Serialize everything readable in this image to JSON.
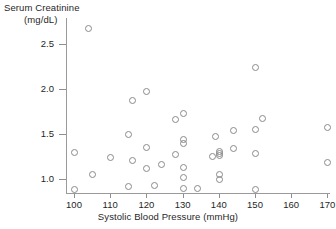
{
  "chart_data": {
    "type": "scatter",
    "title": "",
    "xlabel": "Systolic Blood Pressure (mmHg)",
    "ylabel_line1": "Serum Creatinine",
    "ylabel_line2": "(mg/dL)",
    "xlim": [
      96,
      173
    ],
    "ylim": [
      0.82,
      2.78
    ],
    "xticks": [
      100,
      110,
      120,
      130,
      140,
      150,
      160,
      170
    ],
    "xticklabels": [
      "100",
      "110",
      "120",
      "130",
      "140",
      "150",
      "160",
      "170"
    ],
    "yticks": [
      1.0,
      1.5,
      2.0,
      2.5
    ],
    "yticklabels": [
      "1.0",
      "1.5",
      "2.0",
      "2.5"
    ],
    "grid": false,
    "legend": null,
    "marker": "open-circle",
    "marker_color": "#8a8a8a",
    "points": [
      {
        "x": 100,
        "y": 1.3
      },
      {
        "x": 100,
        "y": 0.89
      },
      {
        "x": 104,
        "y": 2.68
      },
      {
        "x": 105,
        "y": 1.06
      },
      {
        "x": 110,
        "y": 1.24
      },
      {
        "x": 115,
        "y": 1.5
      },
      {
        "x": 115,
        "y": 0.92
      },
      {
        "x": 116,
        "y": 1.88
      },
      {
        "x": 116,
        "y": 1.21
      },
      {
        "x": 120,
        "y": 1.98
      },
      {
        "x": 120,
        "y": 1.36
      },
      {
        "x": 120,
        "y": 1.12
      },
      {
        "x": 122,
        "y": 0.93
      },
      {
        "x": 124,
        "y": 1.17
      },
      {
        "x": 128,
        "y": 1.67
      },
      {
        "x": 128,
        "y": 1.28
      },
      {
        "x": 130,
        "y": 1.73
      },
      {
        "x": 130,
        "y": 1.44
      },
      {
        "x": 130,
        "y": 1.4
      },
      {
        "x": 130,
        "y": 1.13
      },
      {
        "x": 130,
        "y": 1.02
      },
      {
        "x": 130,
        "y": 0.9
      },
      {
        "x": 134,
        "y": 0.9
      },
      {
        "x": 138,
        "y": 1.26
      },
      {
        "x": 139,
        "y": 1.48
      },
      {
        "x": 140,
        "y": 1.31
      },
      {
        "x": 140,
        "y": 1.29
      },
      {
        "x": 140,
        "y": 1.27
      },
      {
        "x": 140,
        "y": 1.06
      },
      {
        "x": 140,
        "y": 1.0
      },
      {
        "x": 144,
        "y": 1.54
      },
      {
        "x": 144,
        "y": 1.35
      },
      {
        "x": 150,
        "y": 2.25
      },
      {
        "x": 150,
        "y": 1.56
      },
      {
        "x": 150,
        "y": 1.29
      },
      {
        "x": 150,
        "y": 0.89
      },
      {
        "x": 152,
        "y": 1.68
      },
      {
        "x": 170,
        "y": 1.58
      },
      {
        "x": 170,
        "y": 1.19
      }
    ]
  }
}
